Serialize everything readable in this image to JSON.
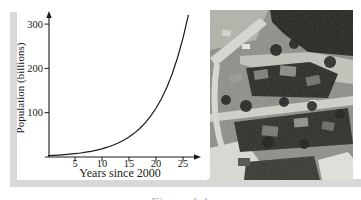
{
  "figure": {
    "caption": "Figure 1.1"
  },
  "chart_data": {
    "type": "line",
    "title": "",
    "xlabel": "Years since 2000",
    "ylabel": "Population (billions)",
    "x": [
      0,
      1,
      2,
      3,
      4,
      5,
      6,
      7,
      8,
      9,
      10,
      11,
      12,
      13,
      14,
      15,
      16,
      17,
      18,
      19,
      20,
      21,
      22,
      23,
      24,
      25,
      26
    ],
    "series": [
      {
        "name": "population",
        "values": [
          3.1,
          3.7,
          4.4,
          5.3,
          6.3,
          7.6,
          9.1,
          10.8,
          12.9,
          15.5,
          18.5,
          22.1,
          26.4,
          31.5,
          37.7,
          45.1,
          53.9,
          64.4,
          77.0,
          92.0,
          110.0,
          131.5,
          157.2,
          187.9,
          224.6,
          268.5,
          321.0
        ]
      }
    ],
    "xticks": [
      5,
      10,
      15,
      20,
      25
    ],
    "yticks": [
      100,
      200,
      300
    ],
    "xlim": [
      0,
      27
    ],
    "ylim": [
      0,
      340
    ],
    "grid": false,
    "legend": "none",
    "line_color": "#1a1a1a"
  },
  "photo": {
    "name": "aerial-photo-of-suburban-neighborhood"
  },
  "colors": {
    "axis": "#1a1a1a",
    "frame_gray": "#d8d8d8",
    "caption_gray": "#b3b3b3",
    "photo_base": "#8e8e87"
  }
}
